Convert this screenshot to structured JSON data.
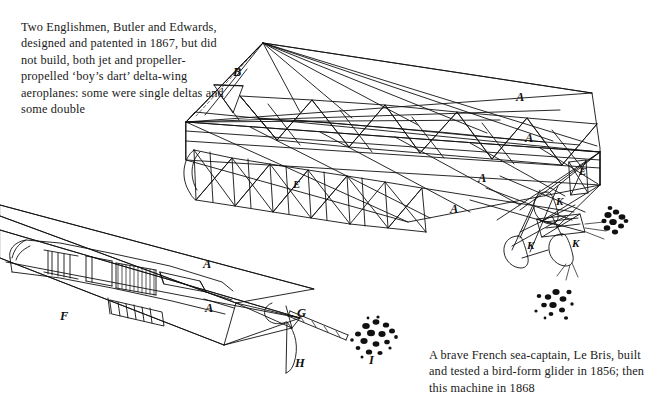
{
  "page": {
    "background_color": "#ffffff",
    "ink_color": "#111111"
  },
  "captions": {
    "top_left": "Two Englishmen, Butler and Edwards, designed and patented in 1867, but did not build, both jet and propeller-propelled ‘boy’s dart’ delta-wing aeroplanes: some were single deltas and some double",
    "bottom_right": "A brave French sea-captain, Le Bris, built and tested a bird-form glider in 1856; then this machine in 1868"
  },
  "figures": {
    "upper": {
      "name": "butler-edwards-delta-wing-aeroplane",
      "labels": [
        {
          "text": "B",
          "x": 233,
          "y": 76
        },
        {
          "text": "A",
          "x": 516,
          "y": 101
        },
        {
          "text": "A",
          "x": 525,
          "y": 142
        },
        {
          "text": "A",
          "x": 478,
          "y": 182
        },
        {
          "text": "A",
          "x": 450,
          "y": 213
        },
        {
          "text": "E",
          "x": 293,
          "y": 188
        },
        {
          "text": "E",
          "x": 579,
          "y": 175
        },
        {
          "text": "K",
          "x": 556,
          "y": 205
        },
        {
          "text": "K",
          "x": 527,
          "y": 249
        },
        {
          "text": "K",
          "x": 572,
          "y": 247
        }
      ]
    },
    "lower": {
      "name": "le-bris-1868-machine",
      "labels": [
        {
          "text": "A",
          "x": 203,
          "y": 268
        },
        {
          "text": "A",
          "x": 205,
          "y": 312
        },
        {
          "text": "F",
          "x": 60,
          "y": 320
        },
        {
          "text": "G",
          "x": 297,
          "y": 317
        },
        {
          "text": "H",
          "x": 295,
          "y": 367
        },
        {
          "text": "I",
          "x": 369,
          "y": 364
        }
      ]
    }
  }
}
